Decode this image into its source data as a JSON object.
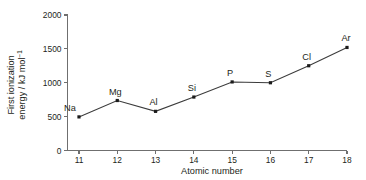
{
  "chart_data": {
    "type": "line",
    "title": "",
    "xlabel": "Atomic number",
    "ylabel_line1": "First ionization",
    "ylabel_line2": "energy / kJ mol",
    "ylabel_superscript": "−1",
    "xlim": [
      10.7,
      18.0
    ],
    "ylim": [
      0,
      2000
    ],
    "x_ticks": [
      11,
      12,
      13,
      14,
      15,
      16,
      17,
      18
    ],
    "x_tick_labels": [
      "11",
      "12",
      "13",
      "14",
      "15",
      "16",
      "17",
      "18"
    ],
    "y_ticks": [
      0,
      500,
      1000,
      1500,
      2000
    ],
    "y_tick_labels": [
      "0",
      "500",
      "1000",
      "1500",
      "2000"
    ],
    "grid": false,
    "legend": false,
    "marker": "square",
    "line_color": "#3b3b3b",
    "marker_color": "#1b1b1b",
    "axis_color": "#6f6f6f",
    "background": "#ffffff",
    "x": [
      11,
      12,
      13,
      14,
      15,
      16,
      17,
      18
    ],
    "values": [
      496,
      738,
      578,
      789,
      1012,
      1000,
      1251,
      1521
    ],
    "point_labels": [
      "Na",
      "Mg",
      "Al",
      "Si",
      "P",
      "S",
      "Cl",
      "Ar"
    ],
    "series": [
      {
        "name": "First ionization energy",
        "values": [
          496,
          738,
          578,
          789,
          1012,
          1000,
          1251,
          1521
        ]
      }
    ]
  }
}
